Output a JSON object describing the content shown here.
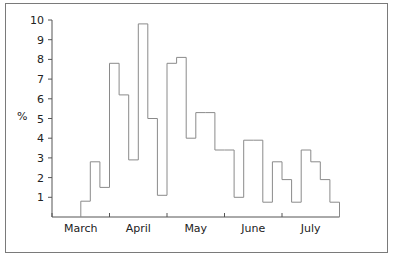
{
  "chart_data": {
    "type": "bar",
    "style": "step-histogram",
    "title": "",
    "xlabel": "",
    "ylabel": "%",
    "ylim": [
      0,
      10
    ],
    "yticks": [
      1,
      2,
      3,
      4,
      5,
      6,
      7,
      8,
      9,
      10
    ],
    "grid": false,
    "legend": null,
    "month_labels": [
      "March",
      "April",
      "May",
      "June",
      "July"
    ],
    "bins_per_month": 6,
    "categories": [
      "Mar-1",
      "Mar-2",
      "Mar-3",
      "Mar-4",
      "Mar-5",
      "Mar-6",
      "Apr-1",
      "Apr-2",
      "Apr-3",
      "Apr-4",
      "Apr-5",
      "Apr-6",
      "May-1",
      "May-2",
      "May-3",
      "May-4",
      "May-5",
      "May-6",
      "Jun-1",
      "Jun-2",
      "Jun-3",
      "Jun-4",
      "Jun-5",
      "Jun-6",
      "Jul-1",
      "Jul-2",
      "Jul-3",
      "Jul-4",
      "Jul-5",
      "Jul-6"
    ],
    "values": [
      0,
      0,
      0,
      0.8,
      2.8,
      1.5,
      7.8,
      6.2,
      2.9,
      9.8,
      5.0,
      1.1,
      7.8,
      8.1,
      4.0,
      5.3,
      5.3,
      3.4,
      3.4,
      1.0,
      3.9,
      3.9,
      0.75,
      2.8,
      1.9,
      0.75,
      3.4,
      2.8,
      1.9,
      0.75
    ]
  },
  "colors": {
    "line": "#8a8a8a",
    "axis": "#555555",
    "frame": "#7a7a7a",
    "text": "#222222"
  }
}
